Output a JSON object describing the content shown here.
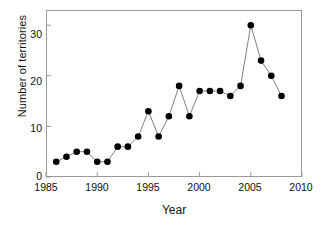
{
  "chart_data": {
    "type": "line",
    "title": "",
    "xlabel": "Year",
    "ylabel": "Number of territories",
    "xlim": [
      1985,
      2010
    ],
    "ylim": [
      0,
      33
    ],
    "xticks": [
      1985,
      1990,
      1995,
      2000,
      2005,
      2010
    ],
    "yticks": [
      0,
      10,
      20,
      30
    ],
    "grid": false,
    "legend": "none",
    "marker": "filled-circle",
    "marker_color": "#000000",
    "line_color": "#808080",
    "x": [
      1986,
      1987,
      1988,
      1989,
      1990,
      1991,
      1992,
      1993,
      1994,
      1995,
      1996,
      1997,
      1998,
      1999,
      2000,
      2001,
      2002,
      2003,
      2004,
      2005,
      2006,
      2007,
      2008
    ],
    "values": [
      3,
      4,
      5,
      5,
      3,
      3,
      6,
      6,
      8,
      13,
      8,
      12,
      18,
      12,
      17,
      17,
      17,
      16,
      18,
      30,
      23,
      20,
      16
    ],
    "series": [
      {
        "name": "Number of territories",
        "values": [
          3,
          4,
          5,
          5,
          3,
          3,
          6,
          6,
          8,
          13,
          8,
          12,
          18,
          12,
          17,
          17,
          17,
          16,
          18,
          30,
          23,
          20,
          16
        ]
      }
    ]
  },
  "axis": {
    "x_title": "Year",
    "y_title": "Number of territories",
    "x_tick_labels": [
      "1985",
      "1990",
      "1995",
      "2000",
      "2005",
      "2010"
    ],
    "y_tick_labels": [
      "0",
      "10",
      "20",
      "30"
    ]
  }
}
